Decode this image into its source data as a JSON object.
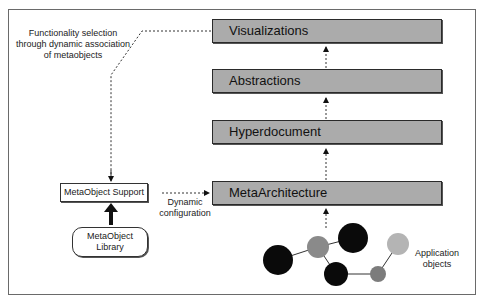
{
  "diagram": {
    "layers": [
      {
        "id": "visualizations",
        "label": "Visualizations"
      },
      {
        "id": "abstractions",
        "label": "Abstractions"
      },
      {
        "id": "hyperdocument",
        "label": "Hyperdocument"
      },
      {
        "id": "metaarchitecture",
        "label": "MetaArchitecture"
      }
    ],
    "metaobject_support": {
      "label": "MetaObject Support"
    },
    "metaobject_library": {
      "line1": "MetaObject",
      "line2": "Library"
    },
    "annotations": {
      "functionality": {
        "line1": "Functionality selection",
        "line2": "through dynamic association",
        "line3": "of metaobjects"
      },
      "dynamic_configuration": {
        "line1": "Dynamic",
        "line2": "configuration"
      },
      "application_objects": {
        "line1": "Application",
        "line2": "objects"
      }
    },
    "colors": {
      "layer_fill": "#ababab",
      "border": "#2a2a2a",
      "node_dark": "#0a0a0a",
      "node_mid": "#8a8a8a",
      "node_light": "#b4b4b4"
    },
    "application_object_nodes": [
      {
        "cx": 278,
        "cy": 260,
        "r": 15,
        "shade": "dark"
      },
      {
        "cx": 318,
        "cy": 247,
        "r": 11,
        "shade": "mid"
      },
      {
        "cx": 353,
        "cy": 238,
        "r": 15,
        "shade": "dark"
      },
      {
        "cx": 336,
        "cy": 274,
        "r": 12,
        "shade": "dark"
      },
      {
        "cx": 378,
        "cy": 274,
        "r": 8,
        "shade": "mid"
      },
      {
        "cx": 398,
        "cy": 244,
        "r": 11,
        "shade": "light"
      }
    ]
  }
}
